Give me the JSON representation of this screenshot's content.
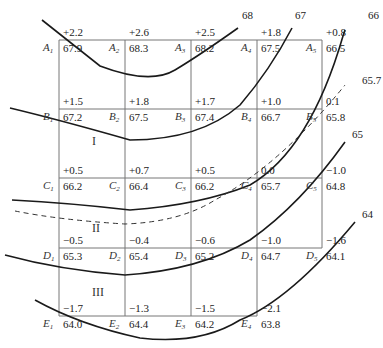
{
  "diagram": {
    "type": "grading-grid-with-contours",
    "columns_x": [
      59,
      125,
      191,
      257,
      322
    ],
    "rows_y": [
      40,
      109,
      178,
      248,
      316
    ],
    "nodes": [
      {
        "id": "A1",
        "label": "A",
        "sub": "1",
        "elev": "67.9",
        "cut": "+2.2"
      },
      {
        "id": "A2",
        "label": "A",
        "sub": "2",
        "elev": "68.3",
        "cut": "+2.6"
      },
      {
        "id": "A3",
        "label": "A",
        "sub": "3",
        "elev": "68.2",
        "cut": "+2.5"
      },
      {
        "id": "A4",
        "label": "A",
        "sub": "4",
        "elev": "67.5",
        "cut": "+1.8"
      },
      {
        "id": "A5",
        "label": "A",
        "sub": "5",
        "elev": "66.5",
        "cut": "+0.8"
      },
      {
        "id": "B1",
        "label": "B",
        "sub": "1",
        "elev": "67.2",
        "cut": "+1.5"
      },
      {
        "id": "B2",
        "label": "B",
        "sub": "2",
        "elev": "67.5",
        "cut": "+1.8"
      },
      {
        "id": "B3",
        "label": "B",
        "sub": "3",
        "elev": "67.4",
        "cut": "+1.7"
      },
      {
        "id": "B4",
        "label": "B",
        "sub": "4",
        "elev": "66.7",
        "cut": "+1.0"
      },
      {
        "id": "B5",
        "label": "B",
        "sub": "5",
        "elev": "65.8",
        "cut": "0.1"
      },
      {
        "id": "C1",
        "label": "C",
        "sub": "1",
        "elev": "66.2",
        "cut": "+0.5"
      },
      {
        "id": "C2",
        "label": "C",
        "sub": "2",
        "elev": "66.4",
        "cut": "+0.7"
      },
      {
        "id": "C3",
        "label": "C",
        "sub": "3",
        "elev": "66.2",
        "cut": "+0.5"
      },
      {
        "id": "C4",
        "label": "C",
        "sub": "4",
        "elev": "65.7",
        "cut": "0.0"
      },
      {
        "id": "C5",
        "label": "C",
        "sub": "5",
        "elev": "64.8",
        "cut": "−1.0"
      },
      {
        "id": "D1",
        "label": "D",
        "sub": "1",
        "elev": "65.3",
        "cut": "−0.5"
      },
      {
        "id": "D2",
        "label": "D",
        "sub": "2",
        "elev": "65.4",
        "cut": "−0.4"
      },
      {
        "id": "D3",
        "label": "D",
        "sub": "3",
        "elev": "65.2",
        "cut": "−0.6"
      },
      {
        "id": "D4",
        "label": "D",
        "sub": "4",
        "elev": "64.7",
        "cut": "−1.0"
      },
      {
        "id": "D5",
        "label": "D",
        "sub": "5",
        "elev": "64.1",
        "cut": "−1.6"
      },
      {
        "id": "E1",
        "label": "E",
        "sub": "1",
        "elev": "64.0",
        "cut": "−1.7"
      },
      {
        "id": "E2",
        "label": "E",
        "sub": "2",
        "elev": "64.4",
        "cut": "−1.3"
      },
      {
        "id": "E3",
        "label": "E",
        "sub": "3",
        "elev": "64.2",
        "cut": "−1.5"
      },
      {
        "id": "E4",
        "label": "E",
        "sub": "4",
        "elev": "63.8",
        "cut": "−2.1"
      }
    ],
    "zones": [
      {
        "label": "I",
        "x": 92,
        "y": 145
      },
      {
        "label": "II",
        "x": 92,
        "y": 232
      },
      {
        "label": "III",
        "x": 92,
        "y": 296
      }
    ],
    "contour_labels": [
      {
        "text": "68",
        "x": 242,
        "y": 19
      },
      {
        "text": "67",
        "x": 295,
        "y": 19
      },
      {
        "text": "66",
        "x": 368,
        "y": 19
      },
      {
        "text": "65.7",
        "x": 362,
        "y": 84
      },
      {
        "text": "65",
        "x": 352,
        "y": 138
      },
      {
        "text": "64",
        "x": 362,
        "y": 218
      }
    ]
  }
}
